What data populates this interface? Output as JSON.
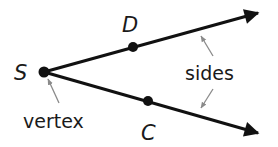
{
  "diagram": {
    "type": "angle",
    "points": {
      "vertex": {
        "label": "S"
      },
      "upper": {
        "label": "D"
      },
      "lower": {
        "label": "C"
      }
    },
    "annotations": {
      "vertex_label": "vertex",
      "sides_label": "sides"
    },
    "colors": {
      "ray": "#111111",
      "pointer_arrow": "#8a8a8a",
      "text": "#1a1a1a"
    }
  }
}
